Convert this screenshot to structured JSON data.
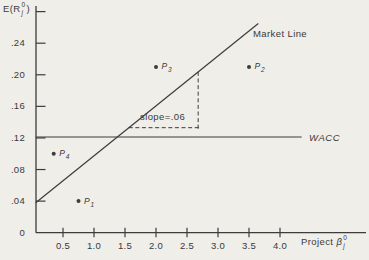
{
  "colors": {
    "background": "#efeee9",
    "ink": "#3c3c3c"
  },
  "chart_data": {
    "type": "scatter",
    "title": "",
    "ylabel": "E(R_j^0)",
    "xlabel": "Project B_j^0",
    "ylabel_parts": {
      "pre": "E(R",
      "sup": "0",
      "sub": "j",
      "post": ")"
    },
    "xlabel_parts": {
      "pre": "Project ",
      "base": "β",
      "sup": "0",
      "sub": "j"
    },
    "xlim": [
      0,
      4.4
    ],
    "ylim": [
      0,
      0.29
    ],
    "grid": false,
    "x_ticks": [
      0.5,
      1.0,
      1.5,
      2.0,
      2.5,
      3.0,
      3.5,
      4.0
    ],
    "x_tick_labels": [
      "0.5",
      "1.0",
      "1.5",
      "2.0",
      "2.5",
      "3.0",
      "3.5",
      "4.0"
    ],
    "y_ticks": [
      0,
      0.04,
      0.08,
      0.12,
      0.16,
      0.2,
      0.24
    ],
    "y_tick_labels": [
      "0",
      ".04",
      ".08",
      ".12",
      ".16",
      ".20",
      ".24"
    ],
    "y_extra_unlabeled_tick": 0.28,
    "points": [
      {
        "label": "P",
        "sub": "1",
        "beta": 0.75,
        "r": 0.04
      },
      {
        "label": "P",
        "sub": "2",
        "beta": 3.5,
        "r": 0.21
      },
      {
        "label": "P",
        "sub": "3",
        "beta": 2.0,
        "r": 0.21
      },
      {
        "label": "P",
        "sub": "4",
        "beta": 0.35,
        "r": 0.1
      }
    ],
    "market_line": {
      "label": "Market Line",
      "x1": 0.06,
      "y1": 0.038,
      "x2": 3.65,
      "y2": 0.265,
      "slope": 0.06
    },
    "wacc_line": {
      "label": "WACC",
      "r": 0.12,
      "x_start": 0.06,
      "x_end": 4.35
    },
    "slope_annotation": {
      "label": "slope=.06",
      "x1": 1.56,
      "x2": 2.68,
      "base_r": 0.133,
      "top_r": 0.204
    }
  }
}
